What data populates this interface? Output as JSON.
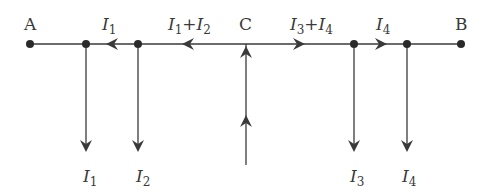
{
  "diagram": {
    "type": "current-distribution",
    "colors": {
      "line": "#3a3a3a",
      "text": "#3a3a3a",
      "background": "#ffffff"
    },
    "nodes": {
      "A": {
        "label": "A",
        "x": 30
      },
      "B": {
        "label": "B",
        "x": 461
      },
      "C": {
        "label": "C",
        "x": 246
      }
    },
    "main_line_y": 44,
    "junctions": [
      {
        "x": 86,
        "branch_label": {
          "var": "I",
          "sub": "1"
        }
      },
      {
        "x": 138,
        "branch_label": {
          "var": "I",
          "sub": "2"
        }
      },
      {
        "x": 354,
        "branch_label": {
          "var": "I",
          "sub": "3"
        }
      },
      {
        "x": 407,
        "branch_label": {
          "var": "I",
          "sub": "4"
        }
      }
    ],
    "segment_labels": [
      {
        "id": "seg-i1",
        "parts": [
          {
            "var": "I",
            "sub": "1"
          }
        ],
        "direction": "left"
      },
      {
        "id": "seg-i1-i2",
        "parts": [
          {
            "var": "I",
            "sub": "1"
          },
          {
            "op": "+"
          },
          {
            "var": "I",
            "sub": "2"
          }
        ],
        "direction": "left"
      },
      {
        "id": "seg-i3-i4",
        "parts": [
          {
            "var": "I",
            "sub": "3"
          },
          {
            "op": "+"
          },
          {
            "var": "I",
            "sub": "4"
          }
        ],
        "direction": "right"
      },
      {
        "id": "seg-i4",
        "parts": [
          {
            "var": "I",
            "sub": "4"
          }
        ],
        "direction": "right"
      }
    ],
    "labels": {
      "A": "A",
      "B": "B",
      "C": "C",
      "I": "I",
      "plus": "+",
      "s1": "1",
      "s2": "2",
      "s3": "3",
      "s4": "4"
    },
    "feed": {
      "x": 246,
      "from_y": 165,
      "to_y": 44,
      "direction": "up"
    }
  }
}
